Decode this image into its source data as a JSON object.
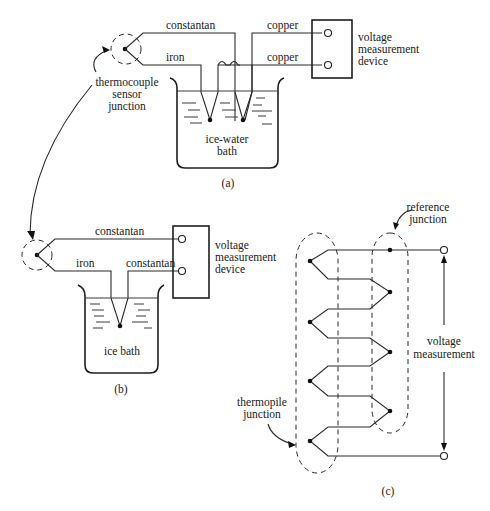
{
  "figure": {
    "panels": {
      "a": {
        "caption": "(a)",
        "wires": {
          "top": "constantan",
          "bottom": "iron",
          "copper_top": "copper",
          "copper_bottom": "copper"
        },
        "sensor_label": [
          "thermocouple",
          "sensor",
          "junction"
        ],
        "bath_label": [
          "ice-water",
          "bath"
        ],
        "device_label": [
          "voltage",
          "measurement",
          "device"
        ]
      },
      "b": {
        "caption": "(b)",
        "wires": {
          "top": "constantan",
          "bottom_left": "iron",
          "bottom_right": "constantan"
        },
        "bath_label": "ice bath",
        "device_label": [
          "voltage",
          "measurement",
          "device"
        ]
      },
      "c": {
        "caption": "(c)",
        "reference_label": [
          "reference",
          "junction"
        ],
        "thermopile_label": [
          "thermopile",
          "junction"
        ],
        "output_label": [
          "voltage",
          "measurement"
        ],
        "junction_pairs": 4
      }
    }
  }
}
